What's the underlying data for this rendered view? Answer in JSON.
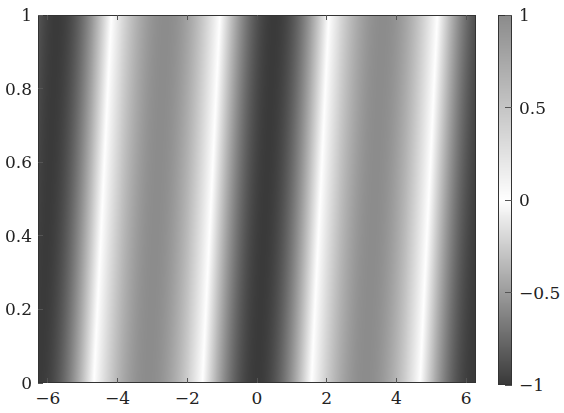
{
  "chart_data": {
    "type": "heatmap",
    "title": "",
    "xlabel": "",
    "ylabel": "",
    "function_estimate": "-cos(x - 0.5*y)",
    "xlim": [
      -6.283,
      6.283
    ],
    "ylim": [
      0,
      1
    ],
    "x_ticks": [
      -6,
      -4,
      -2,
      0,
      2,
      4,
      6
    ],
    "x_tick_labels": [
      "−6",
      "−4",
      "−2",
      "0",
      "2",
      "4",
      "6"
    ],
    "y_ticks": [
      0,
      0.2,
      0.4,
      0.6,
      0.8,
      1
    ],
    "y_tick_labels": [
      "0",
      "0.2",
      "0.4",
      "0.6",
      "0.8",
      "1"
    ],
    "colorbar": {
      "range": [
        -1,
        1
      ],
      "ticks": [
        -1,
        -0.5,
        0,
        0.5,
        1
      ],
      "tick_labels": [
        "−1",
        "−0.5",
        "0",
        "0.5",
        "1"
      ],
      "colormap": [
        {
          "value": -1,
          "color": "#3a3a3a"
        },
        {
          "value": 0,
          "color": "#ffffff"
        },
        {
          "value": 1,
          "color": "#8c8c8c"
        }
      ]
    },
    "grid": false,
    "legend": "colorbar-right"
  }
}
